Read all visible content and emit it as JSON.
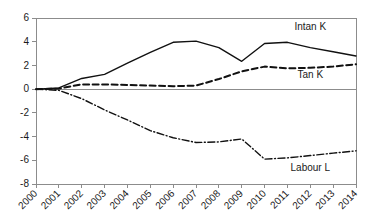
{
  "chart_data": {
    "type": "line",
    "title": "",
    "subtitle": "",
    "xlabel": "",
    "ylabel": "",
    "categories": [
      "2000",
      "2001",
      "2002",
      "2003",
      "2004",
      "2005",
      "2006",
      "2007",
      "2008",
      "2009",
      "2010",
      "2011",
      "2012",
      "2013",
      "2014"
    ],
    "yticks": [
      6,
      4,
      2,
      0,
      -2,
      -4,
      -6,
      -8
    ],
    "ylim": [
      -8,
      6
    ],
    "grid": false,
    "legend_position": "inline-annotations",
    "zero_line": 0,
    "xtick_rotation_deg": 45,
    "series": [
      {
        "name": "Intan K",
        "style": "solid",
        "color": "#111111",
        "label_x_category": "2012",
        "label_value": 5.0,
        "values": [
          0,
          0.1,
          0.9,
          1.25,
          2.2,
          3.1,
          3.95,
          4.05,
          3.5,
          2.35,
          3.85,
          3.95,
          3.5,
          3.15,
          2.8
        ]
      },
      {
        "name": "Tan K",
        "style": "dashed",
        "color": "#111111",
        "label_x_category": "2012",
        "label_value": 0.9,
        "values": [
          0,
          0.05,
          0.4,
          0.4,
          0.35,
          0.3,
          0.25,
          0.3,
          0.85,
          1.5,
          1.9,
          1.75,
          1.8,
          1.9,
          2.1
        ]
      },
      {
        "name": "Labour L",
        "style": "dashdot",
        "color": "#111111",
        "label_x_category": "2012",
        "label_value": -6.9,
        "values": [
          0,
          -0.1,
          -0.8,
          -1.75,
          -2.6,
          -3.5,
          -4.1,
          -4.5,
          -4.45,
          -4.2,
          -5.9,
          -5.8,
          -5.6,
          -5.4,
          -5.2
        ]
      }
    ]
  },
  "figure": {
    "background_color": "#ffffff",
    "axis_color": "#8c8c8c",
    "line_color": "#111111"
  }
}
